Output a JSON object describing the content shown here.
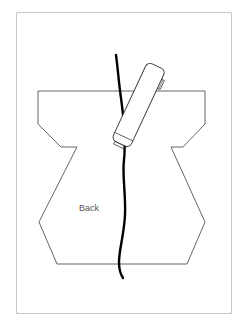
{
  "diagram": {
    "label": "Back",
    "colors": {
      "frame": "#c8c8c8",
      "outline": "#555555",
      "cord": "#000000",
      "handset_stroke": "#333333",
      "handset_fill": "#ffffff"
    },
    "elements": [
      "pattern-piece-outline",
      "cord",
      "handset"
    ]
  }
}
